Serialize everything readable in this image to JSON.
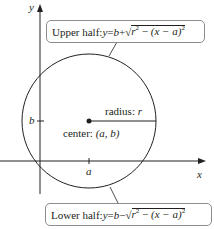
{
  "diagram": {
    "type": "circle-on-coordinate-axes",
    "axes": {
      "x_label": "x",
      "y_label": "y"
    },
    "ticks": {
      "x_tick": "a",
      "y_tick": "b"
    },
    "center": {
      "label_prefix": "center: ",
      "label_value": "(a, b)"
    },
    "radius": {
      "label_prefix": "radius: ",
      "label_value": "r"
    },
    "upper_half": {
      "prefix": "Upper half: ",
      "lhs": "y",
      "eq": " = ",
      "b": "b",
      "op": " + ",
      "sqrt_sign": "√",
      "r": "r",
      "exp": "2",
      "minus": " − ",
      "paren": "(x − a)",
      "paren_exp": "2"
    },
    "lower_half": {
      "prefix": "Lower half: ",
      "lhs": "y",
      "eq": " = ",
      "b": "b",
      "op": " − ",
      "sqrt_sign": "√",
      "r": "r",
      "exp": "2",
      "minus": " − ",
      "paren": "(x − a)",
      "paren_exp": "2"
    },
    "colors": {
      "stroke": "#231f20",
      "box_border": "#8c8c8c",
      "background": "#ffffff"
    }
  }
}
